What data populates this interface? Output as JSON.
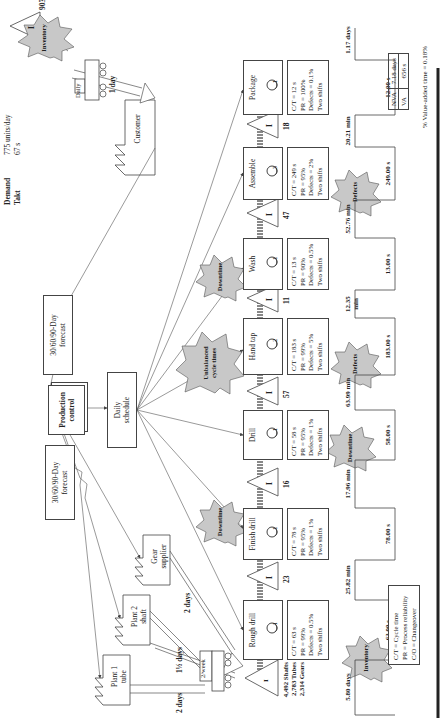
{
  "header": {
    "demand_label": "Demand",
    "demand_value": "775 units/day",
    "takt_label": "Takt",
    "takt_value": "67 s"
  },
  "suppliers": [
    {
      "name_line1": "Plant 1",
      "name_line2": "tube",
      "lead": "2 days"
    },
    {
      "name_line1": "Plant 2",
      "name_line2": "shaft",
      "lead": "1½ days"
    },
    {
      "name_line1": "Gear",
      "name_line2": "supplier",
      "lead": "2 days"
    }
  ],
  "supplier_truck": {
    "frequency": "2/week"
  },
  "control": {
    "forecast_left_line1": "30/60/90-Day",
    "forecast_left_line2": "forecast",
    "production_control_line1": "Production",
    "production_control_line2": "control",
    "forecast_right_line1": "30/60/90-Day",
    "forecast_right_line2": "forecast",
    "daily_schedule_line1": "Daily",
    "daily_schedule_line2": "schedule"
  },
  "customer": {
    "name": "Customer",
    "truck_frequency": "Daily",
    "truck_lead": "1 day"
  },
  "raw_inventory": {
    "symbol": "I",
    "lines": [
      "4,492 Shafts",
      "2,783 Tubes",
      "2,314 Gears"
    ]
  },
  "processes": [
    {
      "name": "Rough drill",
      "operators": "1",
      "ct": "C/T = 63 s",
      "pr": "PR = 99%",
      "defects": "Defects = 0.5%",
      "shifts": "Two shifts"
    },
    {
      "name": "Finish drill",
      "operators": "1",
      "ct": "C/T = 78 s",
      "pr": "PR = 95%",
      "defects": "Defects = 1%",
      "shifts": "Two shifts"
    },
    {
      "name": "Drill",
      "operators": "1",
      "ct": "C/T = 58 s",
      "pr": "PR = 95%",
      "defects": "Defects = 1%",
      "shifts": "Two shifts"
    },
    {
      "name": "Hand tap",
      "operators": "2",
      "ct": "C/T = 183 s",
      "pr": "PR = 99%",
      "defects": "Defects = 5%",
      "shifts": "Two shifts"
    },
    {
      "name": "Wash",
      "operators": "1",
      "ct": "C/T = 13 s",
      "pr": "PR = 90%",
      "defects": "Defects = 0.5%",
      "shifts": "Two shifts"
    },
    {
      "name": "Assemble",
      "operators": "3",
      "ct": "C/T = 249 s",
      "pr": "PR = 95%",
      "defects": "Defects = 2%",
      "shifts": "Two shifts"
    },
    {
      "name": "Package",
      "operators": "1",
      "ct": "C/T = 12 s",
      "pr": "PR = 100%",
      "defects": "Defects = 0.1%",
      "shifts": "Two shifts"
    }
  ],
  "wip_inventory": [
    {
      "symbol": "I",
      "qty": "23"
    },
    {
      "symbol": "I",
      "qty": "16"
    },
    {
      "symbol": "I",
      "qty": "57"
    },
    {
      "symbol": "I",
      "qty": "11"
    },
    {
      "symbol": "I",
      "qty": "47"
    },
    {
      "symbol": "I",
      "qty": "18"
    },
    {
      "symbol": "I",
      "qty": "903"
    }
  ],
  "kaizen_bursts": [
    {
      "label": "Inventory"
    },
    {
      "label": "Downtime"
    },
    {
      "label": "Downtime"
    },
    {
      "label_line1": "Unbalanced",
      "label_line2": "cycle times"
    },
    {
      "label": "Downtime"
    },
    {
      "label": "Defects"
    },
    {
      "label": "Defects"
    },
    {
      "label": "Inventory"
    }
  ],
  "timeline": {
    "wait_times": [
      "5.80 days",
      "25.82 min",
      "17.96 min",
      "63.99 min",
      "12.35 min",
      "52.76 min",
      "20.21 min",
      "1.17 days"
    ],
    "process_times": [
      "63.00 s",
      "78.00 s",
      "58.00 s",
      "183.00 s",
      "13.00 s",
      "249.00 s",
      "12.00 s"
    ]
  },
  "summary": {
    "nva_label": "NVA",
    "nva_value": "7.18 days",
    "va_label": "VA",
    "va_value": "656 s",
    "va_percent": "% Value-added time = 0.18%"
  },
  "legend": {
    "line1": "C/T = Cycle time",
    "line2": "PR = Process reliability",
    "line3": "C/O = Changeover"
  },
  "colors": {
    "burst_fill": "#c8c8c8",
    "line": "#444444",
    "push_arrow": "#999999"
  }
}
